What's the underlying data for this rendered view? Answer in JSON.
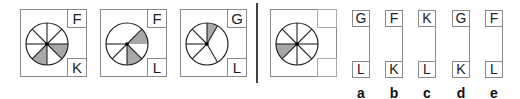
{
  "puzzle": {
    "sequence": [
      {
        "top_letter": "F",
        "bottom_letter": "K",
        "lines_deg": [
          0,
          45,
          90,
          135,
          180,
          225,
          270,
          315
        ],
        "shaded": [
          [
            225,
            270
          ],
          [
            315,
            360
          ]
        ]
      },
      {
        "top_letter": "F",
        "bottom_letter": "L",
        "lines_deg": [
          45,
          180,
          225,
          270,
          315
        ],
        "shaded": [
          [
            0,
            45
          ],
          [
            270,
            315
          ]
        ]
      },
      {
        "top_letter": "G",
        "bottom_letter": "L",
        "lines_deg": [
          60,
          90,
          135,
          180,
          225,
          300
        ],
        "shaded": [
          [
            60,
            90
          ]
        ]
      }
    ],
    "question": {
      "top_letter": "",
      "bottom_letter": "",
      "lines_deg": [
        0,
        45,
        90,
        135,
        180,
        225,
        270,
        315
      ],
      "shaded": [
        [
          180,
          225
        ]
      ]
    },
    "options": [
      {
        "label": "a",
        "top": "G",
        "bottom": "L"
      },
      {
        "label": "b",
        "top": "F",
        "bottom": "K"
      },
      {
        "label": "c",
        "top": "K",
        "bottom": "L"
      },
      {
        "label": "d",
        "top": "G",
        "bottom": "K"
      },
      {
        "label": "e",
        "top": "F",
        "bottom": "L"
      }
    ]
  },
  "colors": {
    "line": "#222222",
    "shade": "#a8a8a8",
    "border": "#8a8a8a"
  }
}
